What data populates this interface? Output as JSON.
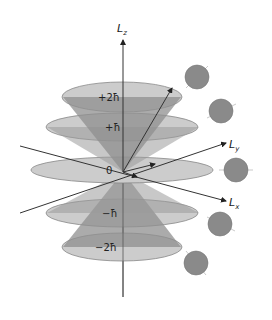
{
  "axes": {
    "z": {
      "label": "L",
      "subscript": "z"
    },
    "y": {
      "label": "L",
      "subscript": "y"
    },
    "x": {
      "label": "L",
      "subscript": "x"
    }
  },
  "levels": [
    {
      "label": "+2ħ"
    },
    {
      "label": "+ħ"
    },
    {
      "label": "0"
    },
    {
      "label": "−ħ"
    },
    {
      "label": "−2ħ"
    }
  ],
  "colors": {
    "disk_fill": "#c8c8c8",
    "cone_fill": "#8e8e8e",
    "sphere_fill": "#8a8a8a",
    "axis": "#333333"
  },
  "spheres_count": 5
}
